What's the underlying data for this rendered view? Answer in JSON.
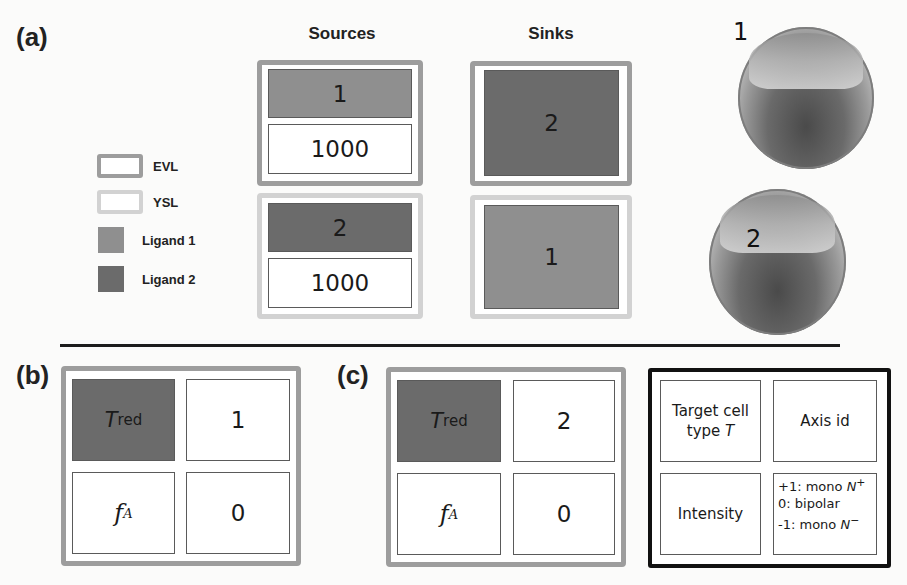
{
  "panel_a": {
    "label": "(a)",
    "columns": {
      "sources": "Sources",
      "sinks": "Sinks"
    },
    "legend": [
      {
        "swatch": "EVL",
        "label": "EVL",
        "color": "#9d9d9d"
      },
      {
        "swatch": "YSL",
        "label": "YSL",
        "color": "#d2d2d2"
      },
      {
        "swatch": "ligand1",
        "label": "Ligand 1",
        "color": "#8f8f8f"
      },
      {
        "swatch": "ligand2",
        "label": "Ligand 2",
        "color": "#6b6b6b"
      }
    ],
    "sources": [
      {
        "layer": "EVL",
        "ligand": "1",
        "amount": "1000"
      },
      {
        "layer": "YSL",
        "ligand": "2",
        "amount": "1000"
      }
    ],
    "sinks": [
      {
        "layer": "EVL",
        "ligand": "2"
      },
      {
        "layer": "YSL",
        "ligand": "1"
      }
    ],
    "embryos": [
      {
        "label": "1"
      },
      {
        "label": "2"
      }
    ]
  },
  "panel_b": {
    "label": "(b)",
    "cells": {
      "target_symbol": "T",
      "target_sub": "red",
      "axis_value": "1",
      "intensity_symbol": "f",
      "intensity_sup": "A",
      "intensity_value": "0"
    }
  },
  "panel_c": {
    "label": "(c)",
    "cells": {
      "target_symbol": "T",
      "target_sub": "red",
      "axis_value": "2",
      "intensity_symbol": "f",
      "intensity_sup": "A",
      "intensity_value": "0"
    }
  },
  "key": {
    "target_line1": "Target cell",
    "target_line2_prefix": "type ",
    "target_line2_symbol": "T",
    "axis": "Axis id",
    "intensity": "Intensity",
    "modes": [
      {
        "prefix": "+1: mono ",
        "symbol": "N",
        "sup": "+"
      },
      {
        "prefix": "0: bipolar",
        "symbol": "",
        "sup": ""
      },
      {
        "prefix": "-1: mono ",
        "symbol": "N",
        "sup": "−"
      }
    ]
  },
  "colors": {
    "evl": "#9d9d9d",
    "ysl": "#d2d2d2",
    "ligand1": "#8f8f8f",
    "ligand2": "#6b6b6b",
    "divider": "#1c1c1c"
  }
}
